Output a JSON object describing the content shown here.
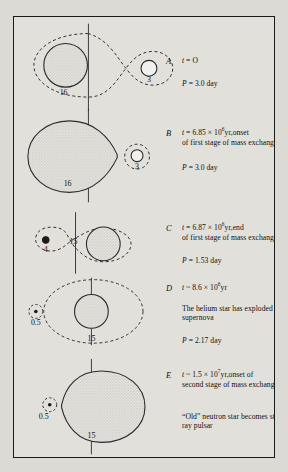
{
  "figure": {
    "type": "astronomy-binary-evolution-diagram",
    "background_color": "#dcdad5",
    "frame_color": "#1a1a1a"
  },
  "panels": [
    {
      "letter": "A",
      "time": "t = O",
      "time_prefix": "t = ",
      "time_value": "O",
      "has_exponent": false,
      "body": "",
      "period": "P = 3.0 day",
      "period_value": "3.0 day",
      "stars": [
        {
          "label": "16",
          "mass": 16,
          "role": "primary",
          "fill": "stippled",
          "shape": "circle"
        },
        {
          "label": "3",
          "mass": 3,
          "role": "secondary",
          "fill": "white",
          "shape": "circle"
        }
      ],
      "roche_lobe": "figure-eight dashed, both stars detached"
    },
    {
      "letter": "B",
      "time_prefix": "t = 6.85 × 10",
      "time_exponent": "6",
      "time_suffix": "yr,onset",
      "has_exponent": true,
      "body": "of first stage of mass exchange",
      "period": "P = 3.0 day",
      "period_value": "3.0 day",
      "stars": [
        {
          "label": "16",
          "mass": 16,
          "role": "primary",
          "fill": "stippled",
          "shape": "roche-filling-teardrop"
        },
        {
          "label": "3",
          "mass": 3,
          "role": "secondary",
          "fill": "white",
          "shape": "circle"
        }
      ],
      "roche_lobe": "primary fills Roche lobe, teardrop toward L1"
    },
    {
      "letter": "C",
      "time_prefix": "t = 6.87 × 10",
      "time_exponent": "6",
      "time_suffix": "yr,end",
      "has_exponent": true,
      "body": "of first stage of mass exchange",
      "period": "P = 1.53 day",
      "period_value": "1.53 day",
      "stars": [
        {
          "label": "4",
          "mass": 4,
          "role": "helium-star",
          "fill": "dark",
          "shape": "small-circle"
        },
        {
          "label": "15",
          "mass": 15,
          "role": "secondary",
          "fill": "stippled",
          "shape": "circle"
        }
      ],
      "roche_lobe": "mass ratio reversed, stripped helium star left"
    },
    {
      "letter": "D",
      "time_prefix": "t ~ 8.6 × 10",
      "time_exponent": "6",
      "time_suffix": "yr",
      "has_exponent": true,
      "body": "The helium star has exploded as a supernova",
      "period": "P = 2.17 day",
      "period_value": "2.17 day",
      "stars": [
        {
          "label": "0.5",
          "mass": 0.5,
          "role": "neutron-star",
          "fill": "dot",
          "shape": "tiny-circle"
        },
        {
          "label": "15",
          "mass": 15,
          "role": "companion",
          "fill": "stippled",
          "shape": "circle"
        }
      ],
      "roche_lobe": "wide detached orbit after supernova"
    },
    {
      "letter": "E",
      "time_prefix": "t ~ 1.5 × 10",
      "time_exponent": "7",
      "time_suffix": "yr,onset of",
      "has_exponent": true,
      "body": "second stage of mass exchange",
      "body2": "“Old” neutron star becomes strong X-ray pulsar",
      "period": "",
      "stars": [
        {
          "label": "0.5",
          "mass": 0.5,
          "role": "neutron-star",
          "fill": "dot",
          "shape": "tiny-circle"
        },
        {
          "label": "15",
          "mass": 15,
          "role": "companion",
          "fill": "stippled",
          "shape": "roche-filling-teardrop"
        }
      ],
      "roche_lobe": "companion fills Roche lobe, transfers to neutron star"
    }
  ]
}
